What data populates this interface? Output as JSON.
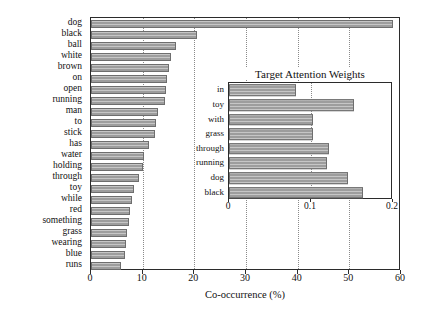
{
  "chart_data": [
    {
      "type": "bar",
      "orientation": "horizontal",
      "title": "",
      "xlabel": "Co-occurrence (%)",
      "ylabel": "",
      "xlim": [
        0,
        60
      ],
      "xticks": [
        0,
        10,
        20,
        30,
        40,
        50,
        60
      ],
      "xtick_labels": [
        "0",
        "10",
        "20",
        "30",
        "40",
        "50",
        "60"
      ],
      "grid": true,
      "bar_color": "#9d9d9d",
      "categories": [
        "dog",
        "black",
        "ball",
        "white",
        "brown",
        "on",
        "open",
        "running",
        "man",
        "to",
        "stick",
        "has",
        "water",
        "holding",
        "through",
        "toy",
        "while",
        "red",
        "something",
        "grass",
        "wearing",
        "blue",
        "runs"
      ],
      "values": [
        58.5,
        20.5,
        16.5,
        15.5,
        15.0,
        14.8,
        14.5,
        14.3,
        13.0,
        12.5,
        12.3,
        11.3,
        10.3,
        10.0,
        9.3,
        8.3,
        8.0,
        7.5,
        7.3,
        7.0,
        6.8,
        6.5,
        5.8
      ]
    },
    {
      "type": "bar",
      "orientation": "horizontal",
      "title": "Target Attention Weights",
      "xlabel": "",
      "ylabel": "",
      "xlim": [
        0,
        0.2
      ],
      "xticks": [
        0,
        0.1,
        0.2
      ],
      "xtick_labels": [
        "0",
        "0.1",
        "0.2"
      ],
      "grid": true,
      "bar_color": "#9d9d9d",
      "categories": [
        "in",
        "toy",
        "with",
        "grass",
        "through",
        "running",
        "dog",
        "black"
      ],
      "values": [
        0.082,
        0.152,
        0.102,
        0.102,
        0.122,
        0.12,
        0.145,
        0.163
      ]
    }
  ]
}
